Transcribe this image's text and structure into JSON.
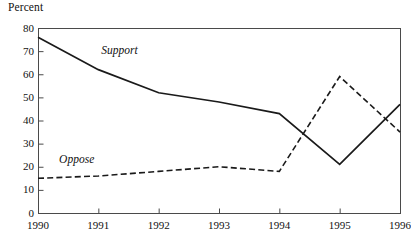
{
  "chart_data": {
    "type": "line",
    "title": "",
    "subtitle": "",
    "xlabel": "",
    "ylabel": "Percent",
    "ylim": [
      0,
      80
    ],
    "xlim": [
      1990,
      1996
    ],
    "yticks": [
      0,
      10,
      20,
      30,
      40,
      50,
      60,
      70,
      80
    ],
    "ytick_labels": [
      "0",
      "10",
      "20",
      "30",
      "40",
      "50",
      "60",
      "70",
      "80"
    ],
    "x": [
      1990,
      1991,
      1992,
      1993,
      1994,
      1995,
      1996
    ],
    "xtick_labels": [
      "1990",
      "1991",
      "1992",
      "1993",
      "1994",
      "1995",
      "1996"
    ],
    "grid": false,
    "legend_position": "inline-annotation",
    "series": [
      {
        "name": "Support",
        "label": "Support",
        "style": "solid",
        "color": "#1a1a1a",
        "values": [
          76,
          62,
          52,
          48,
          43,
          21,
          47
        ]
      },
      {
        "name": "Oppose",
        "label": "Oppose",
        "style": "dashed",
        "color": "#1a1a1a",
        "values": [
          15,
          16,
          18,
          20,
          18,
          59,
          35
        ]
      }
    ],
    "annotations": [
      {
        "text": "Support",
        "x": 1991.05,
        "y": 70
      },
      {
        "text": "Oppose",
        "x": 1990.35,
        "y": 23
      }
    ]
  },
  "axes": {
    "y_title": "Percent"
  }
}
